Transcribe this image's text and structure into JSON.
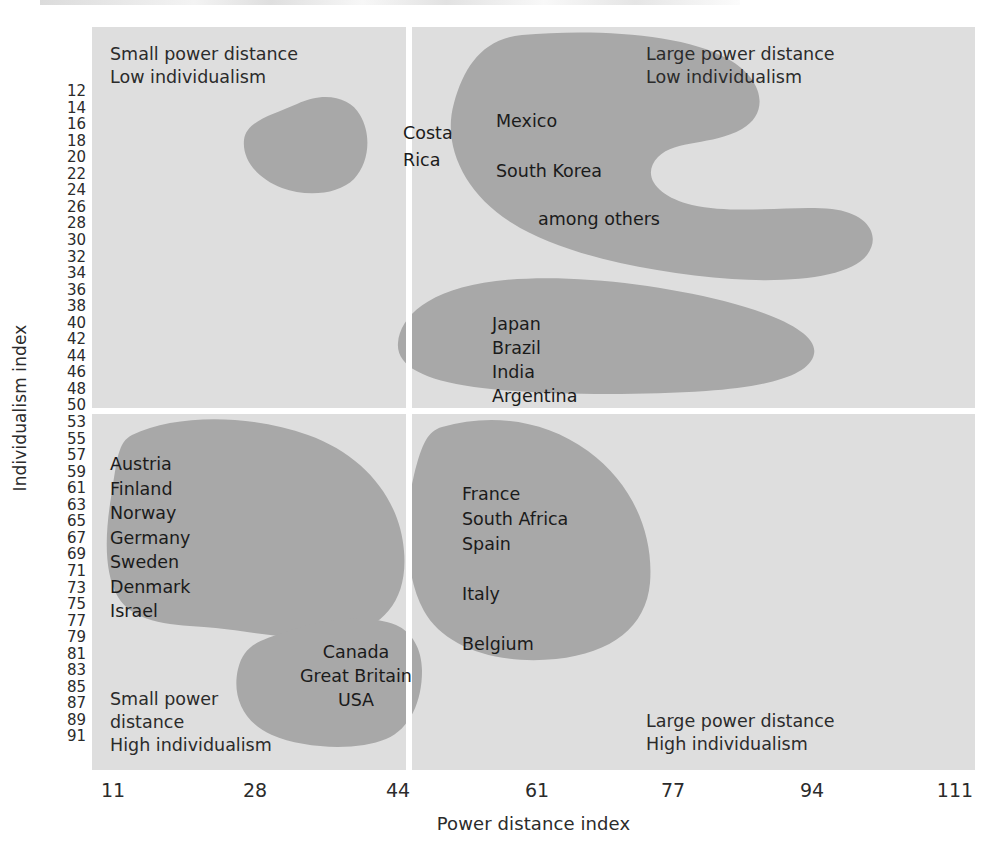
{
  "chart_data": {
    "type": "scatter",
    "title": "",
    "xlabel": "Power distance index",
    "ylabel": "Individualism index",
    "xlim": [
      11,
      111
    ],
    "ylim": [
      12,
      91
    ],
    "x_ticks": [
      "11",
      "28",
      "44",
      "61",
      "77",
      "94",
      "111"
    ],
    "y_ticks": [
      "12",
      "14",
      "16",
      "18",
      "20",
      "22",
      "24",
      "26",
      "28",
      "30",
      "32",
      "34",
      "36",
      "38",
      "40",
      "42",
      "44",
      "46",
      "48",
      "50",
      "53",
      "55",
      "57",
      "59",
      "61",
      "63",
      "65",
      "67",
      "69",
      "71",
      "73",
      "75",
      "77",
      "79",
      "81",
      "83",
      "85",
      "87",
      "89",
      "91"
    ],
    "grid": false,
    "legend": "none",
    "quadrant_labels": [
      {
        "position": "top-left",
        "text": "Small power distance\nLow individualism"
      },
      {
        "position": "top-right",
        "text": "Large power distance\nLow individualism"
      },
      {
        "position": "bottom-left",
        "text": "Small power\ndistance\nHigh individualism"
      },
      {
        "position": "bottom-right",
        "text": "Large power distance\nHigh individualism"
      }
    ],
    "clusters": [
      {
        "name": "costa-rica",
        "label": "Costa\nRica",
        "quadrant": "top-left",
        "countries": [
          "Costa Rica"
        ],
        "approx_x_range": [
          30,
          38
        ],
        "approx_y_range": [
          13,
          25
        ]
      },
      {
        "name": "large-pd-low-idv-crescent",
        "label": "Mexico",
        "label2": "South Korea",
        "label3": "among others",
        "quadrant": "top-right",
        "countries": [
          "Mexico",
          "South Korea",
          "among others"
        ],
        "approx_x_range": [
          48,
          99
        ],
        "approx_y_range": [
          12,
          32
        ]
      },
      {
        "name": "japan-brazil-india-argentina",
        "label": "Japan\nBrazil\nIndia\nArgentina",
        "quadrant": "top-right",
        "countries": [
          "Japan",
          "Brazil",
          "India",
          "Argentina"
        ],
        "approx_x_range": [
          47,
          84
        ],
        "approx_y_range": [
          33,
          50
        ]
      },
      {
        "name": "nordic-germanic",
        "label": "Austria\n Finland\n  Norway\n   Germany\n    Sweden\n     Denmark\n    Israel",
        "quadrant": "bottom-left",
        "countries": [
          "Austria",
          "Finland",
          "Norway",
          "Germany",
          "Sweden",
          "Denmark",
          "Israel"
        ],
        "approx_x_range": [
          11,
          39
        ],
        "approx_y_range": [
          53,
          79
        ]
      },
      {
        "name": "anglo",
        "label": "Canada\nGreat Britain\nUSA",
        "quadrant": "bottom-left",
        "countries": [
          "Canada",
          "Great Britain",
          "USA"
        ],
        "approx_x_range": [
          30,
          46
        ],
        "approx_y_range": [
          79,
          91
        ]
      },
      {
        "name": "latin-europe",
        "label": "France\nSouth Africa\n Spain\n\n  Italy\n\n   Belgium",
        "quadrant": "bottom-right",
        "countries": [
          "France",
          "South Africa",
          "Spain",
          "Italy",
          "Belgium"
        ],
        "approx_x_range": [
          46,
          72
        ],
        "approx_y_range": [
          53,
          85
        ]
      }
    ],
    "colors": {
      "plot_background": "#dedede",
      "cluster_fill": "#a8a8a8",
      "divider": "#ffffff",
      "text": "#231f20",
      "page_background": "#ffffff"
    }
  },
  "axes": {
    "y_title": "Individualism index",
    "x_title": "Power distance index"
  },
  "quadrants": {
    "top_left": "Small power distance\nLow individualism",
    "top_right": "Large power distance\nLow individualism",
    "bottom_left": "Small power\ndistance\nHigh individualism",
    "bottom_right": "Large power distance\nHigh individualism"
  },
  "cluster_text": {
    "costa_rica": "Costa\nRica",
    "mexico": "Mexico",
    "south_korea": "South Korea",
    "among_others": "among others",
    "bric": "Japan\nBrazil\nIndia\nArgentina",
    "nordics": "Austria\n Finland\n  Norway\n   Germany\n    Sweden\n     Denmark\n    Israel",
    "anglo": "Canada\nGreat Britain\nUSA",
    "latin_europe": "France\nSouth Africa\n Spain\n\n  Italy\n\n   Belgium"
  }
}
